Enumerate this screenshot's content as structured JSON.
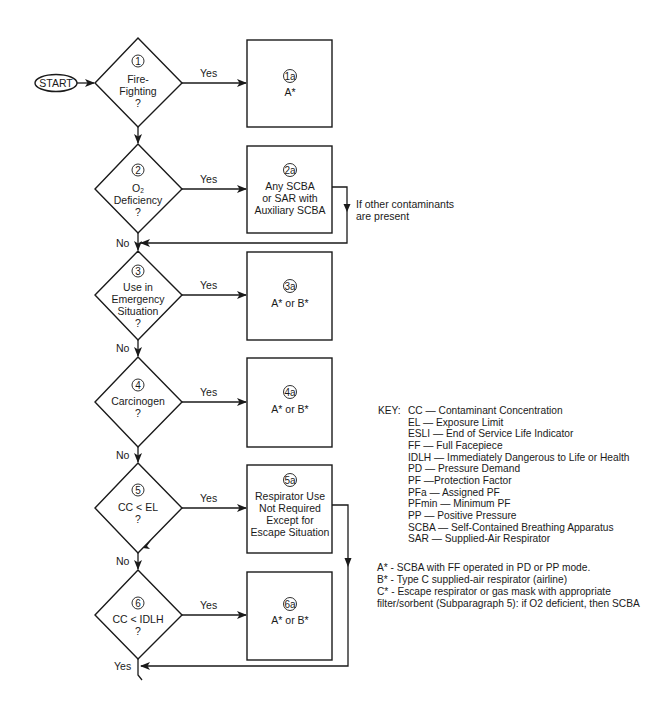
{
  "start": {
    "label": "START"
  },
  "decisions": [
    {
      "num": "1",
      "lines": [
        "Fire-",
        "Fighting",
        "?"
      ],
      "yes": "Yes",
      "no": ""
    },
    {
      "num": "2",
      "lines": [
        "O2",
        "Deficiency",
        "?"
      ],
      "yes": "Yes",
      "no": "No"
    },
    {
      "num": "3",
      "lines": [
        "Use in",
        "Emergency",
        "Situation",
        "?"
      ],
      "yes": "Yes",
      "no": "No"
    },
    {
      "num": "4",
      "lines": [
        "Carcinogen",
        "?"
      ],
      "yes": "Yes",
      "no": "No"
    },
    {
      "num": "5",
      "lines": [
        "CC < EL",
        "?"
      ],
      "yes": "Yes",
      "no": "No"
    },
    {
      "num": "6",
      "lines": [
        "CC < IDLH",
        "?"
      ],
      "yes": "Yes",
      "no": "Yes"
    }
  ],
  "outcomes": [
    {
      "num": "1a",
      "lines": [
        "A*"
      ]
    },
    {
      "num": "2a",
      "lines": [
        "Any SCBA",
        "or SAR with",
        "Auxiliary SCBA"
      ]
    },
    {
      "num": "3a",
      "lines": [
        "A* or B*"
      ]
    },
    {
      "num": "4a",
      "lines": [
        "A* or B*"
      ]
    },
    {
      "num": "5a",
      "lines": [
        "Respirator Use",
        "Not Required",
        "Except for",
        "Escape Situation"
      ]
    },
    {
      "num": "6a",
      "lines": [
        "A* or B*"
      ]
    }
  ],
  "annotations": {
    "other_contaminants": [
      "If other contaminants",
      "are present"
    ]
  },
  "key": {
    "title": "KEY:",
    "items": [
      "CC — Contaminant Concentration",
      "EL — Exposure Limit",
      "ESLI — End of Service Life Indicator",
      "FF — Full Facepiece",
      "IDLH — Immediately Dangerous to Life or Health",
      "PD — Pressure Demand",
      "PF —Protection Factor",
      "PFa — Assigned PF",
      "PFmin — Minimum PF",
      "PP — Positive Pressure",
      "SCBA — Self-Contained Breathing Apparatus",
      "SAR — Supplied-Air Respirator"
    ]
  },
  "notes": [
    "A* - SCBA with FF operated in PD or PP mode.",
    "B* - Type C supplied-air respirator (airline)",
    "C* - Escape respirator or gas mask with appropriate",
    "filter/sorbent (Subparagraph 5): if O2 deficient, then SCBA"
  ]
}
